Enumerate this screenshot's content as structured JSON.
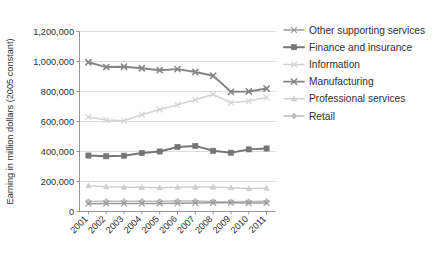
{
  "chart_data": {
    "type": "line",
    "title": "",
    "xlabel": "",
    "ylabel": "Earning in million dollars (2005 constant)",
    "categories": [
      "2001",
      "2002",
      "2003",
      "2004",
      "2005",
      "2006",
      "2007",
      "2008",
      "2009",
      "2010",
      "2011"
    ],
    "ylim": [
      0,
      1200000
    ],
    "ytick_labels": [
      "0",
      "200,000",
      "400,000",
      "600,000",
      "800,000",
      "1,000,000",
      "1,200,000"
    ],
    "ytick_values": [
      0,
      200000,
      400000,
      600000,
      800000,
      1000000,
      1200000
    ],
    "grid": true,
    "legend_position": "right",
    "series": [
      {
        "name": "Other supporting services",
        "color": "#9a9a9a",
        "marker": "x",
        "values": [
          52000,
          54000,
          53000,
          53000,
          54000,
          55000,
          57000,
          58000,
          58000,
          56000,
          56000
        ]
      },
      {
        "name": "Finance and insurance",
        "color": "#767676",
        "marker": "square",
        "values": [
          373000,
          368000,
          372000,
          390000,
          400000,
          430000,
          437000,
          405000,
          392000,
          414000,
          420000
        ]
      },
      {
        "name": "Information",
        "color": "#d4d4d4",
        "marker": "x",
        "values": [
          630000,
          610000,
          605000,
          645000,
          680000,
          712000,
          745000,
          780000,
          725000,
          737000,
          760000
        ]
      },
      {
        "name": "Manufacturing",
        "color": "#858585",
        "marker": "x",
        "values": [
          995000,
          963000,
          965000,
          955000,
          942000,
          949000,
          930000,
          905000,
          798000,
          800000,
          820000
        ]
      },
      {
        "name": "Professional services",
        "color": "#cfcfcf",
        "marker": "triangle",
        "values": [
          172000,
          165000,
          162000,
          161000,
          159000,
          162000,
          163000,
          163000,
          159000,
          153000,
          155000
        ]
      },
      {
        "name": "Retail",
        "color": "#bdbdbd",
        "marker": "diamond",
        "values": [
          66000,
          68000,
          68000,
          69000,
          69000,
          70000,
          70000,
          66000,
          65000,
          67000,
          68000
        ]
      }
    ]
  },
  "legend": {
    "items": [
      {
        "label": "Other supporting services"
      },
      {
        "label": "Finance and insurance"
      },
      {
        "label": "Information"
      },
      {
        "label": "Manufacturing"
      },
      {
        "label": "Professional services"
      },
      {
        "label": "Retail"
      }
    ]
  }
}
